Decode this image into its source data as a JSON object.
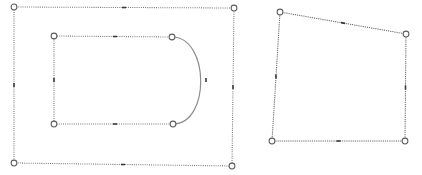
{
  "canvas": {
    "width": 422,
    "height": 175,
    "background_color": "#ffffff",
    "label": "shape editor canvas"
  },
  "style": {
    "edge_color": "#777777",
    "arc_color": "#8a8a8a",
    "vertex_fill": "#fdfdfd",
    "vertex_stroke": "#5d5d5d",
    "midpoint_tick_color": "#3a3a3a",
    "vertex_radius": 2.9,
    "edge_dash": "dotted"
  },
  "shapes": [
    {
      "id": "outer-rectangle",
      "name": "outer bounding rectangle",
      "type": "polygon",
      "closed": true,
      "vertices": [
        {
          "name": "top-left",
          "x": 14,
          "y": 7
        },
        {
          "name": "top-right",
          "x": 234,
          "y": 8
        },
        {
          "name": "bottom-right",
          "x": 232,
          "y": 166
        },
        {
          "name": "bottom-left",
          "x": 14,
          "y": 163
        }
      ],
      "midpoint_ticks": [
        {
          "name": "top-edge-mid",
          "x": 124,
          "y": 7.5,
          "angle": 0
        },
        {
          "name": "right-edge-mid",
          "x": 233,
          "y": 87,
          "angle": 90
        },
        {
          "name": "bottom-edge-mid",
          "x": 123,
          "y": 164.5,
          "angle": 0
        },
        {
          "name": "left-edge-mid",
          "x": 14,
          "y": 85,
          "angle": 90
        }
      ]
    },
    {
      "id": "inner-d-shape",
      "name": "inner rounded D shape",
      "type": "polygon-with-arc",
      "closed": true,
      "vertices": [
        {
          "name": "top-left",
          "x": 54,
          "y": 36
        },
        {
          "name": "top-right",
          "x": 172,
          "y": 37
        },
        {
          "name": "bottom-right",
          "x": 173,
          "y": 124
        },
        {
          "name": "bottom-left",
          "x": 54,
          "y": 124
        }
      ],
      "arc": {
        "name": "right-semicircular-arc",
        "from": "top-right",
        "to": "bottom-right",
        "apex_x": 207,
        "apex_y": 80.5,
        "sweep": "clockwise"
      },
      "midpoint_ticks": [
        {
          "name": "top-edge-mid",
          "x": 115,
          "y": 36.5,
          "angle": 0
        },
        {
          "name": "bottom-edge-mid",
          "x": 115,
          "y": 124,
          "angle": 0
        },
        {
          "name": "left-edge-mid",
          "x": 54,
          "y": 80,
          "angle": 90
        },
        {
          "name": "arc-mid",
          "x": 206,
          "y": 80,
          "angle": 90
        }
      ]
    },
    {
      "id": "right-quadrilateral",
      "name": "right skewed quadrilateral",
      "type": "polygon",
      "closed": true,
      "vertices": [
        {
          "name": "top-left",
          "x": 280,
          "y": 12
        },
        {
          "name": "top-right",
          "x": 406,
          "y": 34
        },
        {
          "name": "bottom-right",
          "x": 405,
          "y": 141
        },
        {
          "name": "bottom-left",
          "x": 272,
          "y": 141
        }
      ],
      "midpoint_ticks": [
        {
          "name": "top-edge-mid",
          "x": 343,
          "y": 23,
          "angle": 10
        },
        {
          "name": "right-edge-mid",
          "x": 405.5,
          "y": 87.5,
          "angle": 90
        },
        {
          "name": "bottom-edge-mid",
          "x": 338.5,
          "y": 141,
          "angle": 0
        },
        {
          "name": "left-edge-mid",
          "x": 276,
          "y": 76.5,
          "angle": 86
        }
      ]
    }
  ]
}
